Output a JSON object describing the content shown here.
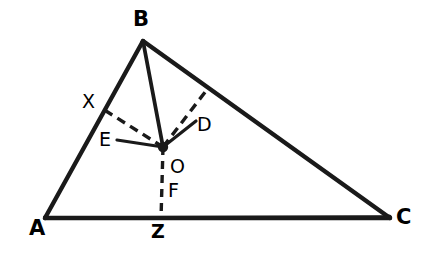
{
  "figure": {
    "kind": "geometry-diagram",
    "background_color": "#ffffff",
    "stroke_color": "#1a1a1a",
    "width": 426,
    "height": 265
  },
  "points": {
    "A": {
      "label": "A",
      "x": 45,
      "y": 218,
      "label_x": 29,
      "label_y": 228
    },
    "B": {
      "label": "B",
      "x": 143,
      "y": 41,
      "label_x": 136,
      "label_y": 10
    },
    "C": {
      "label": "C",
      "x": 390,
      "y": 218,
      "label_x": 398,
      "label_y": 212
    },
    "O": {
      "label": "O",
      "x": 163,
      "y": 147,
      "label_x": 170,
      "label_y": 157
    },
    "X": {
      "label": "X",
      "x": 107,
      "y": 112,
      "label_x": 84,
      "label_y": 92
    },
    "D": {
      "label": "D",
      "x": 208,
      "y": 88,
      "label_x": 196,
      "label_y": 117
    },
    "E": {
      "label": "E",
      "x": 120,
      "y": 141,
      "label_x": 100,
      "label_y": 131
    },
    "F": {
      "label": "F",
      "x": 163,
      "y": 185,
      "label_x": 169,
      "label_y": 182
    },
    "Z": {
      "label": "Z",
      "x": 161,
      "y": 218,
      "label_x": 152,
      "label_y": 228
    }
  },
  "segments": {
    "triangle_sides": [
      {
        "name": "side-AB",
        "from": "A",
        "to": "B",
        "style": "solid",
        "width": 4.2
      },
      {
        "name": "side-BC",
        "from": "B",
        "to": "C",
        "style": "solid",
        "width": 4.2
      },
      {
        "name": "side-AC",
        "from": "A",
        "to": "C",
        "style": "solid",
        "width": 4.2
      }
    ],
    "cevians": [
      {
        "name": "cevian-B-to-Z",
        "from": "B",
        "to": "Z",
        "style": "solid",
        "width": 3.6
      },
      {
        "name": "cevian-A-to-C-through-O",
        "from": "A",
        "to": "C",
        "style": "solid",
        "width": 3.6
      }
    ],
    "perpendiculars_dashed": [
      {
        "name": "perpendicular-O-to-X-on-AB",
        "from": "O",
        "to": "X",
        "style": "dashed",
        "width": 3.4
      },
      {
        "name": "perpendicular-O-to-D-on-BC",
        "from": "O",
        "to": "D",
        "style": "dashed",
        "width": 3.4
      },
      {
        "name": "perpendicular-O-to-Z-on-AC",
        "from": "O",
        "to": "Z",
        "style": "dashed",
        "width": 3.4
      }
    ],
    "leader_lines": [
      {
        "name": "leader-O-to-E-label",
        "from": "O",
        "to": "E",
        "style": "solid",
        "width": 3.2
      },
      {
        "name": "leader-O-to-D-label",
        "from": "O",
        "to": "D-label-anchor",
        "style": "solid",
        "width": 3.2
      }
    ]
  },
  "labels": [
    {
      "key": "A",
      "text": "A",
      "size": "major"
    },
    {
      "key": "B",
      "text": "B",
      "size": "major"
    },
    {
      "key": "C",
      "text": "C",
      "size": "major"
    },
    {
      "key": "X",
      "text": "X",
      "size": "minor"
    },
    {
      "key": "D",
      "text": "D",
      "size": "minor"
    },
    {
      "key": "E",
      "text": "E",
      "size": "minor"
    },
    {
      "key": "O",
      "text": "O",
      "size": "minor"
    },
    {
      "key": "F",
      "text": "F",
      "size": "minor"
    },
    {
      "key": "Z",
      "text": "Z",
      "size": "minor-bold"
    }
  ]
}
